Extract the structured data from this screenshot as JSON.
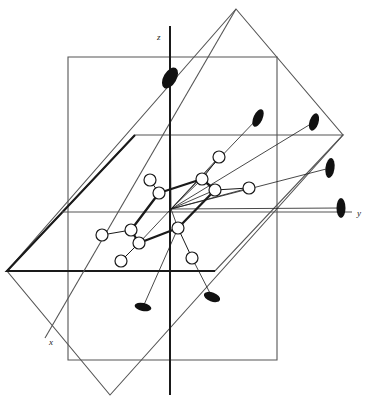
{
  "figure": {
    "title": "Molecular framework in a Cartesian reference frame with mirror planes",
    "background_color": "#ffffff",
    "stroke_color": "#1a1a1a",
    "plane_stroke_color": "#555555",
    "lobe_fill_color": "#111111",
    "atom_fill_color": "#ffffff"
  },
  "axes": [
    {
      "name": "x",
      "label": "x",
      "label_x": 49,
      "label_y": 345,
      "x1": 236,
      "y1": 9,
      "x2": 45,
      "y2": 338
    },
    {
      "name": "y",
      "label": "y",
      "label_x": 357,
      "label_y": 216,
      "x1": 62,
      "y1": 212,
      "x2": 352,
      "y2": 212
    },
    {
      "name": "z",
      "label": "z",
      "label_x": 157,
      "label_y": 40,
      "x1": 170,
      "y1": 26,
      "x2": 170,
      "y2": 395
    }
  ],
  "planes": [
    {
      "name": "vertical-plane",
      "label": "vertical mirror plane",
      "points": "68,57 277,57 277,360 68,360"
    },
    {
      "name": "horizontal-plane",
      "label": "horizontal mirror plane",
      "points": "7,271 135,135 343,135 215,271"
    },
    {
      "name": "diagonal-plane",
      "label": "diagonal mirror plane",
      "points": "236,9 343,135 110,395 7,271"
    }
  ],
  "atoms": [
    {
      "id": "a1",
      "cx": 150,
      "cy": 180,
      "r": 6
    },
    {
      "id": "a2",
      "cx": 159,
      "cy": 193,
      "r": 6
    },
    {
      "id": "a3",
      "cx": 202,
      "cy": 179,
      "r": 6
    },
    {
      "id": "a4",
      "cx": 215,
      "cy": 190,
      "r": 6
    },
    {
      "id": "a5",
      "cx": 219,
      "cy": 157,
      "r": 6
    },
    {
      "id": "a6",
      "cx": 249,
      "cy": 188,
      "r": 6
    },
    {
      "id": "a7",
      "cx": 131,
      "cy": 230,
      "r": 6
    },
    {
      "id": "a8",
      "cx": 139,
      "cy": 243,
      "r": 6
    },
    {
      "id": "a9",
      "cx": 102,
      "cy": 235,
      "r": 6
    },
    {
      "id": "a10",
      "cx": 121,
      "cy": 261,
      "r": 6
    },
    {
      "id": "a11",
      "cx": 178,
      "cy": 228,
      "r": 6
    },
    {
      "id": "a12",
      "cx": 192,
      "cy": 258,
      "r": 6
    },
    {
      "id": "hub",
      "cx": 171,
      "cy": 209,
      "r": 0
    }
  ],
  "bonds": [
    {
      "from": "a2",
      "to": "a1",
      "weight": "thin"
    },
    {
      "from": "a2",
      "to": "a3",
      "weight": "thick"
    },
    {
      "from": "a3",
      "to": "a5",
      "weight": "thin"
    },
    {
      "from": "a3",
      "to": "a4",
      "weight": "thick"
    },
    {
      "from": "a4",
      "to": "a6",
      "weight": "thin"
    },
    {
      "from": "a4",
      "to": "a11",
      "weight": "thick"
    },
    {
      "from": "a2",
      "to": "a7",
      "weight": "thick"
    },
    {
      "from": "a7",
      "to": "a8",
      "weight": "thick"
    },
    {
      "from": "a7",
      "to": "a9",
      "weight": "thin"
    },
    {
      "from": "a8",
      "to": "a10",
      "weight": "thin"
    },
    {
      "from": "a8",
      "to": "a11",
      "weight": "thick"
    },
    {
      "from": "a11",
      "to": "a12",
      "weight": "thin"
    }
  ],
  "hub_rays": [
    {
      "to_atom": "a3"
    },
    {
      "to_atom": "a5"
    },
    {
      "to_atom": "a4"
    },
    {
      "to_atom": "a6"
    },
    {
      "to_atom": "a11"
    },
    {
      "to_atom": "a8"
    }
  ],
  "lobes": [
    {
      "id": "lobe-z",
      "cx": 170,
      "cy": 78,
      "rx": 6.5,
      "ry": 11.5,
      "angle": 30,
      "stem_x": 171,
      "stem_y": 209
    },
    {
      "id": "lobe-ne",
      "cx": 258,
      "cy": 118,
      "rx": 4.5,
      "ry": 9.5,
      "angle": 25,
      "stem_x": 171,
      "stem_y": 209
    },
    {
      "id": "lobe-nne",
      "cx": 314,
      "cy": 122,
      "rx": 4.5,
      "ry": 9.0,
      "angle": 18,
      "stem_x": 171,
      "stem_y": 209
    },
    {
      "id": "lobe-e",
      "cx": 330,
      "cy": 168,
      "rx": 4.5,
      "ry": 10.0,
      "angle": 8,
      "stem_x": 171,
      "stem_y": 209
    },
    {
      "id": "lobe-y",
      "cx": 341,
      "cy": 208,
      "rx": 4.5,
      "ry": 10.0,
      "angle": 0,
      "stem_x": 171,
      "stem_y": 209
    },
    {
      "id": "lobe-sw",
      "cx": 143,
      "cy": 307,
      "rx": 8.5,
      "ry": 4.0,
      "angle": 12,
      "stem_x": 178,
      "stem_y": 228
    },
    {
      "id": "lobe-s",
      "cx": 212,
      "cy": 297,
      "rx": 8.5,
      "ry": 4.5,
      "angle": 20,
      "stem_x": 192,
      "stem_y": 258
    }
  ]
}
